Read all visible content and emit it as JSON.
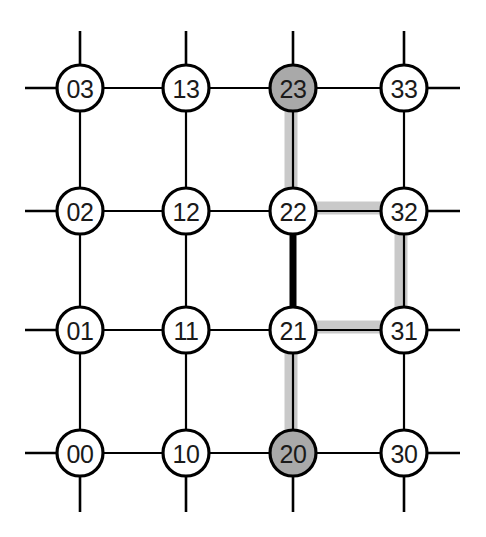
{
  "figure": {
    "width": 486,
    "height": 537,
    "background_color": "#ffffff"
  },
  "style": {
    "node_radius": 23,
    "node_stroke_color": "#000000",
    "node_stroke_width": 3.2,
    "node_fill_default": "#ffffff",
    "node_fill_marked": "#a9a9a9",
    "label_color": "#1a1a1a",
    "label_font_size": 25,
    "edge_color": "#000000",
    "edge_width": 2.2,
    "stub_width": 2.6,
    "highlight_color": "#c9c9c9",
    "highlight_width": 13,
    "bold_edge_color": "#000000",
    "bold_edge_width": 7
  },
  "grid": {
    "columns": 4,
    "rows": 4,
    "column_x": [
      80,
      186,
      293,
      404
    ],
    "row_y": [
      88,
      211,
      330,
      453
    ],
    "stub_left_x": 25,
    "stub_right_x": 460,
    "stub_top_y": 31,
    "stub_bottom_y": 512
  },
  "nodes": [
    {
      "id": "03",
      "label": "03",
      "col": 0,
      "row": 0,
      "cx": 80,
      "cy": 88,
      "fill": "#ffffff",
      "marked": false
    },
    {
      "id": "13",
      "label": "13",
      "col": 1,
      "row": 0,
      "cx": 186,
      "cy": 88,
      "fill": "#ffffff",
      "marked": false
    },
    {
      "id": "23",
      "label": "23",
      "col": 2,
      "row": 0,
      "cx": 293,
      "cy": 88,
      "fill": "#a9a9a9",
      "marked": true
    },
    {
      "id": "33",
      "label": "33",
      "col": 3,
      "row": 0,
      "cx": 404,
      "cy": 88,
      "fill": "#ffffff",
      "marked": false
    },
    {
      "id": "02",
      "label": "02",
      "col": 0,
      "row": 1,
      "cx": 80,
      "cy": 211,
      "fill": "#ffffff",
      "marked": false
    },
    {
      "id": "12",
      "label": "12",
      "col": 1,
      "row": 1,
      "cx": 186,
      "cy": 211,
      "fill": "#ffffff",
      "marked": false
    },
    {
      "id": "22",
      "label": "22",
      "col": 2,
      "row": 1,
      "cx": 293,
      "cy": 211,
      "fill": "#ffffff",
      "marked": false
    },
    {
      "id": "32",
      "label": "32",
      "col": 3,
      "row": 1,
      "cx": 404,
      "cy": 211,
      "fill": "#ffffff",
      "marked": false
    },
    {
      "id": "01",
      "label": "01",
      "col": 0,
      "row": 2,
      "cx": 80,
      "cy": 330,
      "fill": "#ffffff",
      "marked": false
    },
    {
      "id": "11",
      "label": "11",
      "col": 1,
      "row": 2,
      "cx": 186,
      "cy": 330,
      "fill": "#ffffff",
      "marked": false
    },
    {
      "id": "21",
      "label": "21",
      "col": 2,
      "row": 2,
      "cx": 293,
      "cy": 330,
      "fill": "#ffffff",
      "marked": false
    },
    {
      "id": "31",
      "label": "31",
      "col": 3,
      "row": 2,
      "cx": 404,
      "cy": 330,
      "fill": "#ffffff",
      "marked": false
    },
    {
      "id": "00",
      "label": "00",
      "col": 0,
      "row": 3,
      "cx": 80,
      "cy": 453,
      "fill": "#ffffff",
      "marked": false
    },
    {
      "id": "10",
      "label": "10",
      "col": 1,
      "row": 3,
      "cx": 186,
      "cy": 453,
      "fill": "#ffffff",
      "marked": false
    },
    {
      "id": "20",
      "label": "20",
      "col": 2,
      "row": 3,
      "cx": 293,
      "cy": 453,
      "fill": "#a9a9a9",
      "marked": true
    },
    {
      "id": "30",
      "label": "30",
      "col": 3,
      "row": 3,
      "cx": 404,
      "cy": 453,
      "fill": "#ffffff",
      "marked": false
    }
  ],
  "edges_horizontal": [
    {
      "from": "03",
      "to": "13",
      "x1": 80,
      "x2": 186,
      "y": 88
    },
    {
      "from": "13",
      "to": "23",
      "x1": 186,
      "x2": 293,
      "y": 88
    },
    {
      "from": "23",
      "to": "33",
      "x1": 293,
      "x2": 404,
      "y": 88
    },
    {
      "from": "02",
      "to": "12",
      "x1": 80,
      "x2": 186,
      "y": 211
    },
    {
      "from": "12",
      "to": "22",
      "x1": 186,
      "x2": 293,
      "y": 211
    },
    {
      "from": "22",
      "to": "32",
      "x1": 293,
      "x2": 404,
      "y": 211
    },
    {
      "from": "01",
      "to": "11",
      "x1": 80,
      "x2": 186,
      "y": 330
    },
    {
      "from": "11",
      "to": "21",
      "x1": 186,
      "x2": 293,
      "y": 330
    },
    {
      "from": "21",
      "to": "31",
      "x1": 293,
      "x2": 404,
      "y": 330
    },
    {
      "from": "00",
      "to": "10",
      "x1": 80,
      "x2": 186,
      "y": 453
    },
    {
      "from": "10",
      "to": "20",
      "x1": 186,
      "x2": 293,
      "y": 453
    },
    {
      "from": "20",
      "to": "30",
      "x1": 293,
      "x2": 404,
      "y": 453
    }
  ],
  "edges_vertical": [
    {
      "from": "03",
      "to": "02",
      "x": 80,
      "y1": 88,
      "y2": 211
    },
    {
      "from": "02",
      "to": "01",
      "x": 80,
      "y1": 211,
      "y2": 330
    },
    {
      "from": "01",
      "to": "00",
      "x": 80,
      "y1": 330,
      "y2": 453
    },
    {
      "from": "13",
      "to": "12",
      "x": 186,
      "y1": 88,
      "y2": 211
    },
    {
      "from": "12",
      "to": "11",
      "x": 186,
      "y1": 211,
      "y2": 330
    },
    {
      "from": "11",
      "to": "10",
      "x": 186,
      "y1": 330,
      "y2": 453
    },
    {
      "from": "23",
      "to": "22",
      "x": 293,
      "y1": 88,
      "y2": 211
    },
    {
      "from": "22",
      "to": "21",
      "x": 293,
      "y1": 211,
      "y2": 330
    },
    {
      "from": "21",
      "to": "20",
      "x": 293,
      "y1": 330,
      "y2": 453
    },
    {
      "from": "33",
      "to": "32",
      "x": 404,
      "y1": 88,
      "y2": 211
    },
    {
      "from": "32",
      "to": "31",
      "x": 404,
      "y1": 211,
      "y2": 330
    },
    {
      "from": "31",
      "to": "30",
      "x": 404,
      "y1": 330,
      "y2": 453
    }
  ],
  "wraparound_stubs": [
    {
      "node": "03",
      "dir": "left",
      "x1": 25,
      "y1": 88,
      "x2": 80,
      "y2": 88
    },
    {
      "node": "02",
      "dir": "left",
      "x1": 25,
      "y1": 211,
      "x2": 80,
      "y2": 211
    },
    {
      "node": "01",
      "dir": "left",
      "x1": 25,
      "y1": 330,
      "x2": 80,
      "y2": 330
    },
    {
      "node": "00",
      "dir": "left",
      "x1": 25,
      "y1": 453,
      "x2": 80,
      "y2": 453
    },
    {
      "node": "33",
      "dir": "right",
      "x1": 404,
      "y1": 88,
      "x2": 460,
      "y2": 88
    },
    {
      "node": "32",
      "dir": "right",
      "x1": 404,
      "y1": 211,
      "x2": 460,
      "y2": 211
    },
    {
      "node": "31",
      "dir": "right",
      "x1": 404,
      "y1": 330,
      "x2": 460,
      "y2": 330
    },
    {
      "node": "30",
      "dir": "right",
      "x1": 404,
      "y1": 453,
      "x2": 460,
      "y2": 453
    },
    {
      "node": "03",
      "dir": "top",
      "x1": 80,
      "y1": 31,
      "x2": 80,
      "y2": 88
    },
    {
      "node": "13",
      "dir": "top",
      "x1": 186,
      "y1": 31,
      "x2": 186,
      "y2": 88
    },
    {
      "node": "23",
      "dir": "top",
      "x1": 293,
      "y1": 31,
      "x2": 293,
      "y2": 88
    },
    {
      "node": "33",
      "dir": "top",
      "x1": 404,
      "y1": 31,
      "x2": 404,
      "y2": 88
    },
    {
      "node": "00",
      "dir": "bottom",
      "x1": 80,
      "y1": 453,
      "x2": 80,
      "y2": 512
    },
    {
      "node": "10",
      "dir": "bottom",
      "x1": 186,
      "y1": 453,
      "x2": 186,
      "y2": 512
    },
    {
      "node": "20",
      "dir": "bottom",
      "x1": 293,
      "y1": 453,
      "x2": 293,
      "y2": 512
    },
    {
      "node": "30",
      "dir": "bottom",
      "x1": 404,
      "y1": 453,
      "x2": 404,
      "y2": 512
    }
  ],
  "highlighted_path": {
    "color": "#c9c9c9",
    "width": 13,
    "description": "Gray band marking the route from node 23 down to node 20 via 22, 32, 31, 21",
    "segments": [
      {
        "from": "23",
        "to": "22",
        "orientation": "vertical",
        "x": 291,
        "y1": 88,
        "y2": 211
      },
      {
        "from": "22",
        "to": "32",
        "orientation": "horizontal",
        "y": 208,
        "x1": 293,
        "x2": 404
      },
      {
        "from": "32",
        "to": "31",
        "orientation": "vertical",
        "x": 401,
        "y1": 211,
        "y2": 330
      },
      {
        "from": "31",
        "to": "21",
        "orientation": "horizontal",
        "y": 327,
        "x1": 293,
        "x2": 404
      },
      {
        "from": "21",
        "to": "20",
        "orientation": "vertical",
        "x": 291,
        "y1": 330,
        "y2": 453
      }
    ]
  },
  "bold_edges": [
    {
      "from": "22",
      "to": "21",
      "orientation": "vertical",
      "x": 293,
      "y1": 211,
      "y2": 330,
      "color": "#000000",
      "width": 7
    }
  ]
}
